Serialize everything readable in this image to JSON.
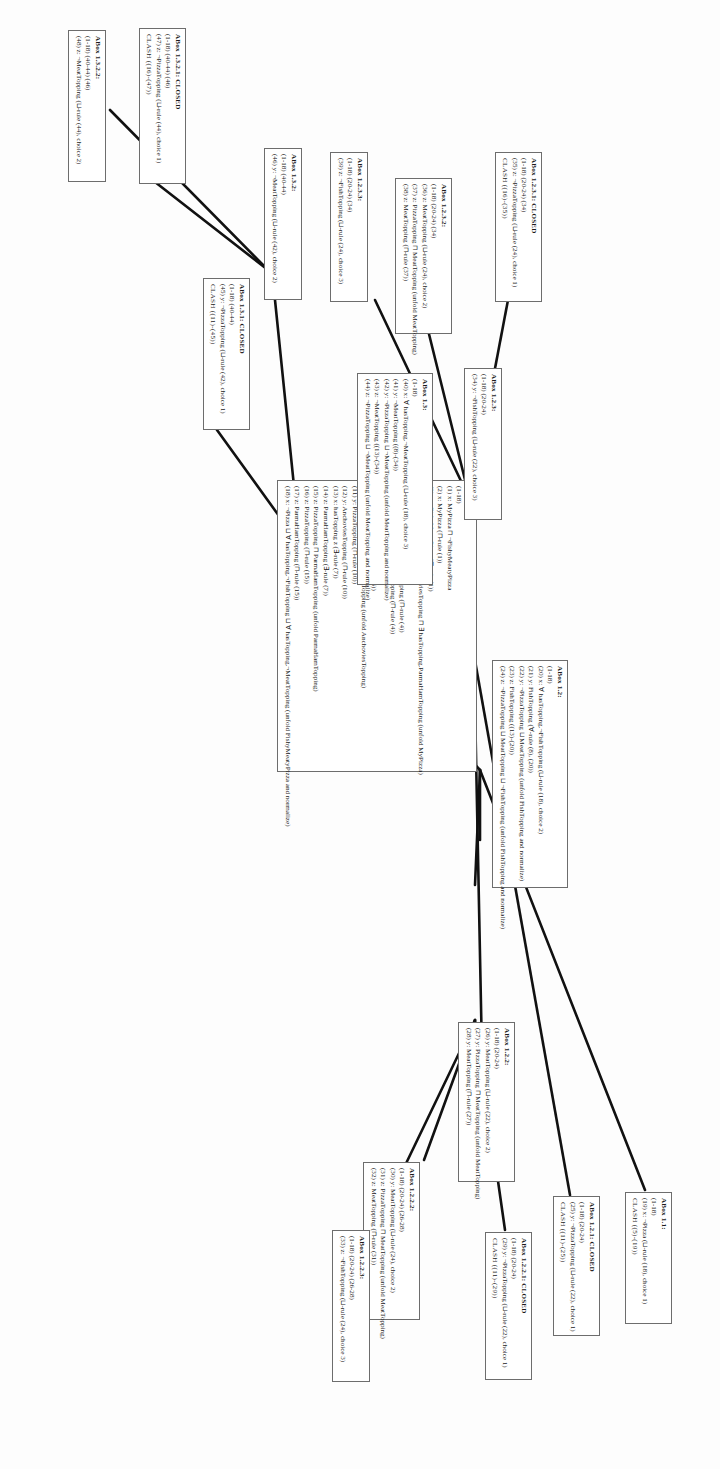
{
  "figure": {
    "type": "tableau-proof-tree",
    "orientation": "rotated-90-ccw"
  },
  "boxes": [
    {
      "id": "abox-1",
      "header": "ABox 1:",
      "lines": [
        "(1-18)",
        "(1)  x:  MyPizza ⊓ ¬FishyMeatyPizza",
        "(2)  x:  MyPizza (⊓-rule (1))",
        "(3)  x:  ¬FishyMeatyPizza (⊓-rule (1))",
        "(4)  x:  Pizza (⊓ hasTopping.AnchoviesTopping ⊓ ∃ hasTopping.ParmaHamTopping (unfold MyPizza)",
        "(5)  x:  Pizza (⊓-rule (4))",
        "(6)  x:  ∃ hasTopping.AnchoviesTopping (⊓-rule (4))",
        "(7)  x:  ∃ hasTopping.ParmaHamTopping (⊓-rule (4))",
        "(8)  x:  hasTopping.y (∃-rule (6))",
        "(9)  y:  AnchoviesTopping (∃-rule (6))",
        "(10) y:  PizzaTopping ⊓ AnchoviesTopping (unfold AnchoviesTopping)",
        "(11) y:  PizzaTopping (⊓-rule (10))",
        "(12) y:  AnchoviesTopping (⊓-rule (10))",
        "(13) x:  hasTopping z (∃-rule (7))",
        "(14) z:  ParmaHamTopping (∃-rule (7))",
        "(15) z:  PizzaTopping ⊓ ParmaHamTopping (unfold ParmaHamTopping)",
        "(16) z:  PizzaTopping (⊓-rule (15))",
        "(17) z:  ParmaHamTopping (⊓-rule (15))",
        "(18) x:  ¬Pizza ⊔ ∀ hasTopping.¬FishTopping ⊔ ∀ hasTopping.¬MeatTopping (unfold FishyMeatyPizza and normalize)"
      ]
    },
    {
      "id": "abox-1-1",
      "header": "ABox 1.1:",
      "lines": [
        "(1-18)",
        "(19) x: ¬Pizza (⊔-rule (18), choice 1)",
        "CLASH ((5)-(19))"
      ]
    },
    {
      "id": "abox-1-2",
      "header": "ABox 1.2:",
      "lines": [
        "(1-18)",
        "(20) x: ∀ hasTopping.¬FishTopping (⊔-rule (18), choice 2)",
        "(21) y: FishTopping (∀-rule (8), (20))",
        "(22) y: ¬PizzaTopping ⊔ MeatTopping (unfold FishTopping and normalize)",
        "(23) z: FishTopping ((13)-(20))",
        "(24) z: ¬PizzaTopping ⊔ MeatTopping ⊔ ¬FishTopping (unfold FishTopping and normalize)"
      ]
    },
    {
      "id": "abox-1-3",
      "header": "ABox 1.3:",
      "lines": [
        "(1-18)",
        "(40) x: ∀ hasTopping.¬MeatTopping (⊔-rule (18), choice 3)",
        "(41) y: ¬MeatTopping ((8)-(34))",
        "(42) y: ¬PizzaTopping ⊔ ¬MeatTopping (unfold MeatTopping and normalize)",
        "(43) z: ¬MeatTopping ((13)-(34))",
        "(44) z: ¬PizzaTopping ⊔ ¬MeatTopping (unfold MeatTopping and normalize)"
      ]
    },
    {
      "id": "abox-1-2-1",
      "header": "ABox 1.2.1: CLOSED",
      "lines": [
        "(1-18) (20-24)",
        "(25) y: ¬PizzaTopping (⊔-rule (22), choice 1)",
        "CLASH ((11)-(25))"
      ]
    },
    {
      "id": "abox-1-2-2",
      "header": "ABox 1.2.2:",
      "lines": [
        "(1-18) (20-24)",
        "(26) y: MeatTopping (⊔-rule (22), choice 2)",
        "(27) y: PizzaTopping ⊓ MeatTopping (unfold MeatTopping)",
        "(28) y: MeatTopping (⊓-rule (27))"
      ]
    },
    {
      "id": "abox-1-2-2-2",
      "header": "ABox 1.2.2.2:",
      "lines": [
        "(1-18) (20-24) (26-28)",
        "(30) y: MeatTopping (⊔-rule (24), choice 2)",
        "(31) z: PizzaTopping ⊓ MeatTopping (unfold MeatTopping)",
        "(32) z: MeatTopping (⊓-rule (31))"
      ]
    },
    {
      "id": "abox-1-2-2-1",
      "header": "ABox 1.2.2.1: CLOSED",
      "lines": [
        "(1-18) (20-24)",
        "(29) y: ¬PizzaTopping (⊔-rule (22), choice 1)",
        "CLASH ((11)-(29))"
      ]
    },
    {
      "id": "abox-1-2-2-3",
      "header": "ABox 1.2.2.3:",
      "lines": [
        "(1-18) (20-24) (26-28)",
        "(33) z: ¬FishTopping (⊔-rule (24), choice 3)"
      ]
    },
    {
      "id": "abox-1-2-3",
      "header": "ABox 1.2.3:",
      "lines": [
        "(1-18) (20-24)",
        "(34) y: ¬FishTopping (⊔-rule (22), choice 3)"
      ]
    },
    {
      "id": "abox-1-2-3-1",
      "header": "ABox 1.2.3.1: CLOSED",
      "lines": [
        "(1-18) (20-24) (34)",
        "(35) z: ¬PizzaTopping (⊔-rule (24), choice 1)",
        "CLASH ((16)-(35))"
      ]
    },
    {
      "id": "abox-1-2-3-2",
      "header": "ABox 1.2.3.2:",
      "lines": [
        "(1-18) (20-24) (34)",
        "(36) z: MeatTopping (⊔-rule (24), choice 2)",
        "(37) z: PizzaTopping ⊓ MeatTopping (unfold MeatTopping)",
        "(38) z: MeatTopping (⊓-rule (37))"
      ]
    },
    {
      "id": "abox-1-2-3-3",
      "header": "ABox 1.2.3.3:",
      "lines": [
        "(1-18) (20-24) (34)",
        "(39) z: ¬FishTopping (⊔-rule (24), choice 3)"
      ]
    },
    {
      "id": "abox-1-3-1",
      "header": "ABox 1.3.1: CLOSED",
      "lines": [
        "(1-18) (40-44)",
        "(45) y: ¬PizzaTopping (⊔-rule (42), choice 1)",
        "CLASH ((11)-(45))"
      ]
    },
    {
      "id": "abox-1-3-2",
      "header": "ABox 1.3.2:",
      "lines": [
        "(1-18) (40-44)",
        "(46) y: ¬MeatTopping (⊔-rule (42), choice 2)"
      ]
    },
    {
      "id": "abox-1-3-2-1",
      "header": "ABox 1.3.2.1: CLOSED",
      "lines": [
        "(1-18) (40-44) (46)",
        "(47) z: ¬PizzaTopping (⊔-rule (44), choice 1)",
        "CLASH ((16)-(47))"
      ]
    },
    {
      "id": "abox-1-3-2-2",
      "header": "ABox 1.3.2.2:",
      "lines": [
        "(1-18) (40-44) (46)",
        "(48) z: ¬MeatTopping (⊔-rule (44), choice 2)"
      ]
    }
  ],
  "colors": {
    "box_border": "#6d6d6d",
    "edge": "#111111",
    "text": "#1b1b1b",
    "background": "#fdfdfd"
  }
}
